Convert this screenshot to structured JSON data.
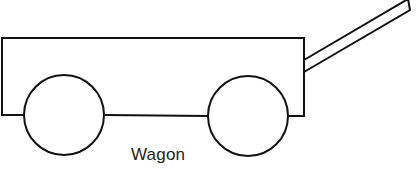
{
  "diagram": {
    "caption": "Wagon",
    "stroke_color": "#111111",
    "background": "#ffffff",
    "parts": [
      {
        "name": "wagon-body",
        "shape": "open-bottom rectangle"
      },
      {
        "name": "front-wheel",
        "shape": "circle"
      },
      {
        "name": "rear-wheel",
        "shape": "circle"
      },
      {
        "name": "handle",
        "shape": "slanted bar"
      }
    ]
  }
}
